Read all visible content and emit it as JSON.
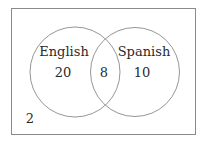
{
  "diagram": {
    "type": "venn",
    "universe": {
      "outside_count": "2"
    },
    "sets": [
      {
        "name": "English",
        "only_count": "20"
      },
      {
        "name": "Spanish",
        "only_count": "10"
      }
    ],
    "intersection": {
      "sets": [
        "English",
        "Spanish"
      ],
      "count": "8"
    },
    "colors": {
      "stroke": "#8a8a8a",
      "text": "#2a2a2a",
      "background": "#ffffff"
    }
  }
}
